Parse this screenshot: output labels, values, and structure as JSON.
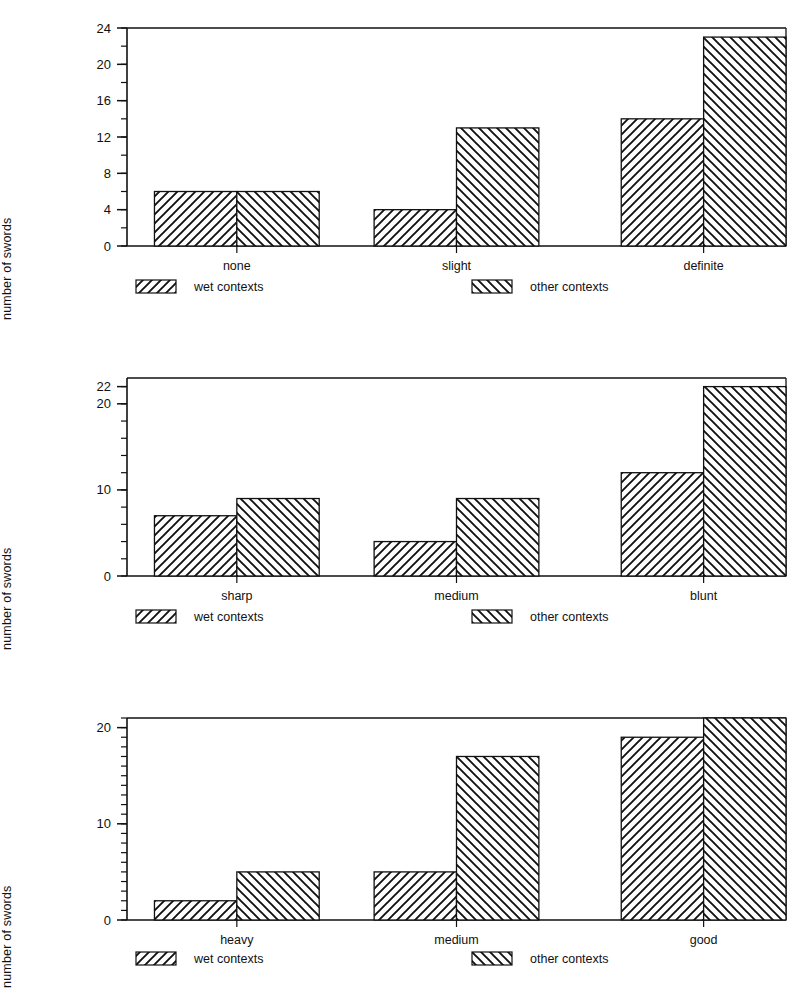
{
  "figure": {
    "background": "#ffffff",
    "ink": "#111111",
    "panel_count": 3
  },
  "legend": {
    "series": [
      {
        "key": "wet",
        "label": "wet contexts",
        "hatch": "forward-diagonal",
        "swatch_name": "wet-contexts-swatch"
      },
      {
        "key": "other",
        "label": "other contexts",
        "hatch": "backward-diagonal",
        "swatch_name": "other-contexts-swatch"
      }
    ]
  },
  "chart_data": [
    {
      "id": "panel-0",
      "type": "bar",
      "title": "",
      "xlabel": "",
      "ylabel": "number of swords",
      "categories": [
        "none",
        "slight",
        "definite"
      ],
      "series": [
        {
          "name": "wet contexts",
          "values": [
            6,
            4,
            14
          ]
        },
        {
          "name": "other contexts",
          "values": [
            6,
            13,
            23
          ]
        }
      ],
      "ylim": [
        0,
        24
      ],
      "yticks": [
        0,
        4,
        8,
        12,
        16,
        20,
        24
      ],
      "ytick_labels": [
        "0",
        "4",
        "8",
        "12",
        "16",
        "20",
        "24"
      ],
      "yminor_step": 2,
      "grid": false,
      "legend_position": "below-axis"
    },
    {
      "id": "panel-1",
      "type": "bar",
      "title": "",
      "xlabel": "",
      "ylabel": "number of swords",
      "categories": [
        "sharp",
        "medium",
        "blunt"
      ],
      "series": [
        {
          "name": "wet contexts",
          "values": [
            7,
            4,
            12
          ]
        },
        {
          "name": "other contexts",
          "values": [
            9,
            9,
            22
          ]
        }
      ],
      "ylim": [
        0,
        23
      ],
      "yticks": [
        0,
        10,
        20,
        22
      ],
      "ytick_labels": [
        "0",
        "10",
        "20",
        "22"
      ],
      "yminor_step": 2,
      "grid": false,
      "legend_position": "below-axis"
    },
    {
      "id": "panel-2",
      "type": "bar",
      "title": "",
      "xlabel": "",
      "ylabel": "number of swords",
      "categories": [
        "heavy",
        "medium",
        "good"
      ],
      "series": [
        {
          "name": "wet contexts",
          "values": [
            2,
            5,
            19
          ]
        },
        {
          "name": "other contexts",
          "values": [
            5,
            17,
            21
          ]
        }
      ],
      "ylim": [
        0,
        21
      ],
      "yticks": [
        0,
        10,
        20
      ],
      "ytick_labels": [
        "0",
        "10",
        "20"
      ],
      "yminor_step": 1,
      "grid": false,
      "legend_position": "below-axis"
    }
  ]
}
